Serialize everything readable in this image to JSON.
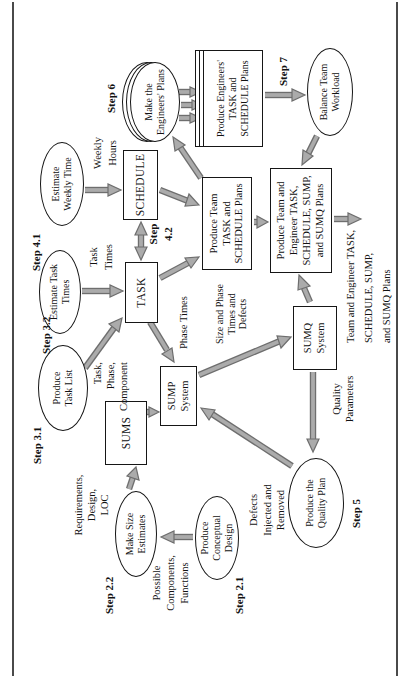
{
  "colors": {
    "arrow_fill": "#ababab",
    "arrow_outline": "#6e6e6e",
    "shape_outline": "#161616",
    "rule": "#4a4a4a",
    "text": "#121212"
  },
  "diagram": {
    "step_labels": {
      "s21": "Step 2.1",
      "s22": "Step 2.2",
      "s31": "Step 3.1",
      "s32": "Step 3.2",
      "s41": "Step 4.1",
      "s42": "Step\n4.2",
      "s5": "Step 5",
      "s6": "Step 6",
      "s7": "Step 7"
    },
    "ellipses": {
      "conceptual": "Produce\nConceptual\nDesign",
      "size_estimates": "Make Size\nEstimates",
      "task_list": "Produce\nTask List",
      "task_times": "Estimate Task\nTimes",
      "weekly_time": "Estimate\nWeekly Time",
      "engineers_plans": "Make the\nEngineers' Plans",
      "balance": "Balance Team\nWorkload",
      "quality_plan": "Produce the\nQuality Plan"
    },
    "boxes": {
      "sums": "SUMS",
      "sump": "SUMP\nSystem",
      "sumq": "SUMQ\nSystem",
      "task": "TASK",
      "schedule": "SCHEDULE",
      "team_plans": "Produce Team\nTASK and\nSCHEDULE Plans",
      "engineers_plans": "Produce Engineers'\nTASK and\nSCHEDULE Plans",
      "team_engineer_plans": "Produce Team and\nEngineer TASK,\nSCHEDULE, SUMP,\nand SUMQ Plans"
    },
    "flow_labels": {
      "possible": "Possible\nComponents,\nFunctions",
      "requirements": "Requirements,\nDesign,\nLOC",
      "task_phase": "Task,\nPhase,\nComponent",
      "task_times": "Task\nTimes",
      "weekly_hours": "Weekly\nHours",
      "phase_times": "Phase Times",
      "size_phase": "Size and Phase\nTimes and\nDefects",
      "defects": "Defects\nInjected and\nRemoved",
      "quality_params": "Quality\nParameters",
      "output": "Team and Engineer TASK,\nSCHEDULE, SUMP,\nand SUMQ Plans"
    }
  }
}
